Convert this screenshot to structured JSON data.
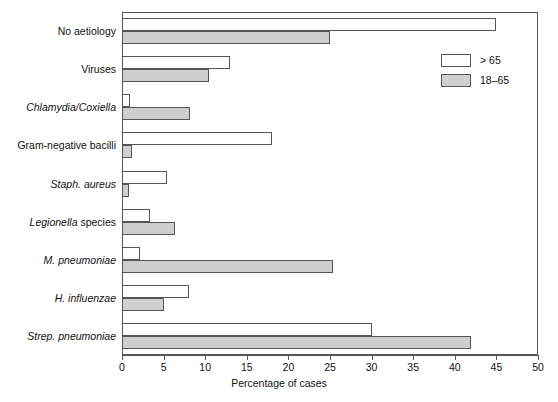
{
  "chart_data": {
    "type": "bar",
    "orientation": "horizontal",
    "title": "",
    "xlabel": "Percentage of cases",
    "ylabel": "",
    "xlim": [
      0,
      50
    ],
    "xticks": [
      0,
      5,
      10,
      15,
      20,
      25,
      30,
      35,
      40,
      45,
      50
    ],
    "grid": false,
    "legend_position": "top-right",
    "categories": [
      "No aetiology",
      "Viruses",
      "Chlamydia/Coxiella",
      "Gram-negative bacilli",
      "Staph. aureus",
      "Legionella species",
      "M. pneumoniae",
      "H. influenzae",
      "Strep. pneumoniae"
    ],
    "category_styles": [
      "roman",
      "roman",
      "italic",
      "roman",
      "italic",
      "italic-partial",
      "italic",
      "italic",
      "italic"
    ],
    "series": [
      {
        "name": "> 65",
        "color": "#ffffff",
        "edge_color": "#555555",
        "values": [
          45,
          13,
          1,
          18,
          5.4,
          3.4,
          2.2,
          8,
          30
        ]
      },
      {
        "name": "18–65",
        "color": "#cfcfcf",
        "edge_color": "#555555",
        "values": [
          25,
          10.5,
          8.2,
          1.2,
          0.8,
          6.4,
          25.4,
          5,
          42
        ]
      }
    ]
  },
  "legend": {
    "items": [
      {
        "label": "> 65",
        "swatch": "white"
      },
      {
        "label": "18–65",
        "swatch": "gray"
      }
    ]
  },
  "axis": {
    "title": "Percentage of cases",
    "tick_labels": [
      "0",
      "5",
      "10",
      "15",
      "20",
      "25",
      "30",
      "35",
      "40",
      "45",
      "50"
    ]
  },
  "colors": {
    "series_old": "#ffffff",
    "series_young": "#cfcfcf",
    "outline": "#555555",
    "text": "#111111",
    "background": "#ffffff"
  }
}
